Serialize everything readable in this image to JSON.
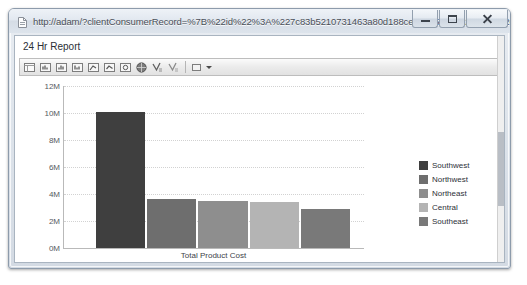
{
  "window": {
    "title": "http://adam/?clientConsumerRecord=%7B%22id%22%3A%227c83b5210731463a80d188ce50ad5efc%22%2C%22Cli - Windo...",
    "favicon_icon": "page-icon",
    "buttons": {
      "minimize": "minimize-button",
      "maximize": "maximize-button",
      "close": "close-button"
    }
  },
  "report": {
    "title": "24 Hr Report",
    "toolbar": {
      "items": [
        {
          "name": "document-map-icon",
          "glyph": "▤"
        },
        {
          "name": "first-page-icon",
          "glyph": "▮"
        },
        {
          "name": "previous-page-icon",
          "glyph": "▮"
        },
        {
          "name": "next-page-icon",
          "glyph": "▮"
        },
        {
          "name": "last-page-icon",
          "glyph": "▮"
        },
        {
          "name": "refresh-icon",
          "glyph": "↻"
        },
        {
          "name": "print-icon",
          "glyph": "⎙"
        },
        {
          "name": "export-icon",
          "glyph": "●"
        },
        {
          "name": "find-icon",
          "glyph": "✓"
        },
        {
          "name": "find-next-icon",
          "glyph": "✓"
        },
        {
          "name": "zoom-select-icon",
          "glyph": "▭"
        }
      ]
    }
  },
  "chart_data": {
    "type": "bar",
    "title": "",
    "xlabel": "Total Product Cost",
    "ylabel": "",
    "categories": [
      "Southwest",
      "Northwest",
      "Northeast",
      "Central",
      "Southeast"
    ],
    "values": [
      10100000,
      3600000,
      3500000,
      3400000,
      2900000
    ],
    "ylim": [
      0,
      12000000
    ],
    "ytick_labels": [
      "0M",
      "2M",
      "4M",
      "6M",
      "8M",
      "10M",
      "12M"
    ],
    "ytick_values": [
      0,
      2000000,
      4000000,
      6000000,
      8000000,
      10000000,
      12000000
    ],
    "grid": true,
    "legend_position": "right",
    "series_colors": [
      "#3f3f3f",
      "#6e6e6e",
      "#8e8e8e",
      "#b4b4b4",
      "#797979"
    ],
    "legend": [
      {
        "label": "Southwest",
        "color": "#3f3f3f"
      },
      {
        "label": "Northwest",
        "color": "#6e6e6e"
      },
      {
        "label": "Northeast",
        "color": "#8e8e8e"
      },
      {
        "label": "Central",
        "color": "#b4b4b4"
      },
      {
        "label": "Southeast",
        "color": "#797979"
      }
    ]
  }
}
